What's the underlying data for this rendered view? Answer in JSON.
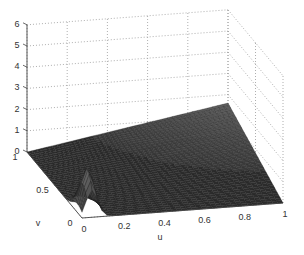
{
  "chart_data": {
    "type": "surface",
    "title": "",
    "xlabel": "u",
    "ylabel": "v",
    "zlabel": "",
    "x_ticks": [
      "0",
      "0.2",
      "0.4",
      "0.6",
      "0.8",
      "1"
    ],
    "y_ticks": [
      "0",
      "0.5",
      "1"
    ],
    "z_ticks": [
      "0",
      "1",
      "2",
      "3",
      "4",
      "5",
      "6"
    ],
    "xlim": [
      0,
      1
    ],
    "ylim": [
      0,
      1
    ],
    "zlim": [
      0,
      6
    ],
    "grid": true,
    "colormap": "gray (dark mesh)",
    "features": {
      "peak": {
        "u": 0.05,
        "v": 0.05,
        "z": 2.0
      },
      "corner_u1_v1_z": 1.6,
      "corner_u0_v1_z": 0.0,
      "corner_u1_v0_z": 0.0
    }
  },
  "axes": {
    "x_label": "u",
    "y_label": "v",
    "x_ticks": [
      "0",
      "0.2",
      "0.4",
      "0.6",
      "0.8",
      "1"
    ],
    "y_ticks": [
      "0",
      "0.5",
      "1"
    ],
    "z_ticks": [
      "0",
      "1",
      "2",
      "3",
      "4",
      "5",
      "6"
    ]
  }
}
